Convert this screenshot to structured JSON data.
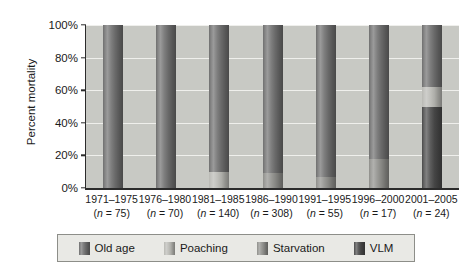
{
  "chart_data": {
    "type": "bar",
    "subtype": "stacked-bar-100-percent",
    "title": "",
    "xlabel": "",
    "ylabel": "Percent mortality",
    "ylim": [
      0,
      100
    ],
    "ytick_labels": [
      "0%",
      "20%",
      "40%",
      "60%",
      "80%",
      "100%"
    ],
    "ytick_values": [
      0,
      20,
      40,
      60,
      80,
      100
    ],
    "grid": true,
    "legend_position": "bottom",
    "categories": [
      "1971–1975",
      "1976–1980",
      "1981–1985",
      "1986–1990",
      "1991–1995",
      "1996–2000",
      "2001–2005"
    ],
    "sample_sizes": [
      "(n = 75)",
      "(n = 70)",
      "(n = 140)",
      "(n = 308)",
      "(n = 55)",
      "(n = 17)",
      "(n = 24)"
    ],
    "series": [
      {
        "name": "Old age",
        "color": "#6f6f6f",
        "values": [
          100,
          100,
          90,
          91,
          93,
          82,
          38
        ]
      },
      {
        "name": "Poaching",
        "color": "#b9b9b4",
        "values": [
          0,
          0,
          10,
          0,
          0,
          0,
          12
        ]
      },
      {
        "name": "Starvation",
        "color": "#8f8f8b",
        "values": [
          0,
          0,
          0,
          9,
          7,
          18,
          0
        ]
      },
      {
        "name": "VLM",
        "color": "#4a4a4a",
        "values": [
          0,
          0,
          0,
          0,
          0,
          0,
          50
        ]
      }
    ]
  },
  "legend": {
    "items": [
      {
        "label": "Old age",
        "color": "#6f6f6f"
      },
      {
        "label": "Poaching",
        "color": "#b9b9b4"
      },
      {
        "label": "Starvation",
        "color": "#8f8f8b"
      },
      {
        "label": "VLM",
        "color": "#4a4a4a"
      }
    ]
  },
  "style": {
    "plot_background": "#c8c9c4",
    "gridline_color": "#efefec",
    "axis_color": "#2b2b2b",
    "legend_background": "#e9e9e5",
    "legend_border": "#8d8e89",
    "text_color": "#1a1a1a"
  }
}
